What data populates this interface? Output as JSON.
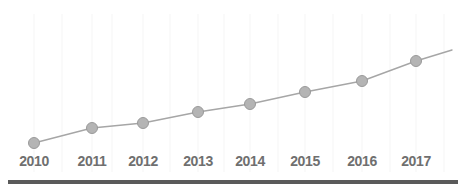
{
  "chart_data": {
    "type": "line",
    "title": "",
    "subtitle": "",
    "xlabel": "",
    "ylabel": "",
    "grid": true,
    "grid_orientation": "vertical",
    "legend": "none",
    "categories": [
      "2010",
      "2011",
      "2012",
      "2013",
      "2014",
      "2015",
      "2016",
      "2017"
    ],
    "series": [
      {
        "name": "Series 1",
        "values": [
          1.0,
          1.6,
          1.8,
          2.25,
          2.57,
          3.05,
          3.49,
          4.29
        ],
        "pixel_points": [
          {
            "x": 34,
            "y": 143
          },
          {
            "x": 92,
            "y": 128
          },
          {
            "x": 143,
            "y": 123
          },
          {
            "x": 198,
            "y": 112
          },
          {
            "x": 250,
            "y": 104
          },
          {
            "x": 305,
            "y": 92
          },
          {
            "x": 362,
            "y": 81
          },
          {
            "x": 416,
            "y": 61
          }
        ],
        "line_extends_past_last_point_to": {
          "x": 452,
          "y": 50
        }
      }
    ],
    "ylim": [
      0,
      5
    ],
    "y_axis_visible": false,
    "marker": "circle",
    "marker_radius": 5.5,
    "annotations": []
  },
  "style": {
    "background": "#ffffff",
    "line_color": "#a6a6a6",
    "marker_fill": "#b4b4b4",
    "marker_stroke": "#9a9a9a",
    "label_color": "#6f6f6f",
    "gridline_color": "#fafafa",
    "baseline_bar_color": "#5a5a5a"
  },
  "axis": {
    "x_tick_positions_px": [
      34,
      92,
      143,
      198,
      250,
      305,
      362,
      416
    ],
    "gridline_positions_px": [
      34,
      62,
      92,
      112,
      143,
      170,
      198,
      224,
      250,
      278,
      305,
      333,
      362,
      390,
      416,
      444
    ]
  }
}
